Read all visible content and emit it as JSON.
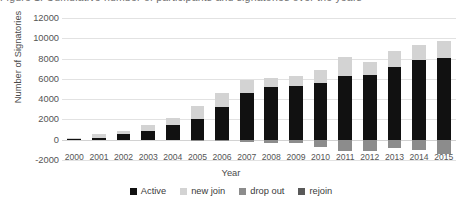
{
  "caption": {
    "text": "Figure 1. Cumulative number of participants and signatories over the years"
  },
  "chart_data": {
    "type": "bar",
    "subtype": "stacked-column",
    "title": "",
    "xlabel": "Year",
    "ylabel": "Number of Signatories",
    "ylim": [
      -2000,
      12000
    ],
    "ytick_step": 2000,
    "yticks": [
      "12000",
      "10000",
      "8000",
      "6000",
      "4000",
      "2000",
      "0",
      "-2000"
    ],
    "ytick_values": [
      12000,
      10000,
      8000,
      6000,
      4000,
      2000,
      0,
      -2000
    ],
    "grid": true,
    "grid_axis": "y",
    "legend_position": "bottom",
    "categories": [
      "2000",
      "2001",
      "2002",
      "2003",
      "2004",
      "2005",
      "2006",
      "2007",
      "2008",
      "2009",
      "2010",
      "2011",
      "2012",
      "2013",
      "2014",
      "2015"
    ],
    "series": [
      {
        "name": "Active",
        "color": "#111111",
        "values": [
          40,
          130,
          520,
          830,
          1450,
          2080,
          3250,
          4600,
          5150,
          5250,
          5600,
          6300,
          6350,
          7200,
          7900,
          8100
        ]
      },
      {
        "name": "new join",
        "color": "#d3d3d3",
        "values": [
          110,
          400,
          320,
          640,
          650,
          1200,
          1400,
          1250,
          950,
          1000,
          1250,
          1900,
          1350,
          1550,
          1450,
          1600
        ]
      },
      {
        "name": "drop out",
        "color": "#8c8c8c",
        "values": [
          0,
          0,
          0,
          0,
          0,
          -60,
          -120,
          -180,
          -320,
          -360,
          -700,
          -1150,
          -1150,
          -800,
          -1000,
          -1400
        ]
      },
      {
        "name": "rejoin",
        "color": "#595959",
        "values": [
          0,
          0,
          0,
          0,
          0,
          0,
          0,
          0,
          0,
          0,
          0,
          0,
          0,
          0,
          0,
          0
        ]
      }
    ]
  },
  "legend": {
    "items": [
      {
        "label": "Active",
        "color": "#111111"
      },
      {
        "label": "new join",
        "color": "#d3d3d3"
      },
      {
        "label": "drop out",
        "color": "#8c8c8c"
      },
      {
        "label": "rejoin",
        "color": "#595959"
      }
    ]
  }
}
